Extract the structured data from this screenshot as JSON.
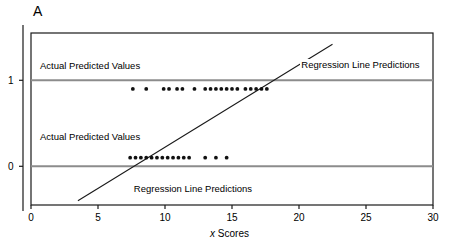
{
  "figure": {
    "panel_label": "A",
    "colors": {
      "frame": "#1a1a1a",
      "reference_line": "#8c8c8c",
      "regression_line": "#1a1a1a",
      "dot": "#111111",
      "text": "#000000"
    }
  },
  "chart_data": {
    "type": "scatter",
    "title": "",
    "subtitle": "",
    "xlabel": "x Scores",
    "xlabel_italic_prefix": "x",
    "xlabel_rest": " Scores",
    "ylabel": "",
    "xlim": [
      0,
      30
    ],
    "ylim": [
      -0.45,
      1.55
    ],
    "xticks": [
      0,
      5,
      10,
      15,
      20,
      25,
      30
    ],
    "xticklabels": [
      "0",
      "5",
      "10",
      "15",
      "20",
      "25",
      "30"
    ],
    "yticks": [
      0,
      1
    ],
    "yticklabels": [
      "0",
      "1"
    ],
    "grid": false,
    "legend": "none",
    "series": [
      {
        "name": "Actual predicted values (y = 1)",
        "type": "scatter",
        "y": 0.9,
        "x": [
          7.6,
          8.6,
          9.9,
          10.3,
          10.9,
          11.3,
          12.2,
          13.0,
          13.4,
          13.8,
          14.2,
          14.6,
          15.0,
          15.4,
          16.0,
          16.4,
          16.8,
          17.2,
          17.6
        ]
      },
      {
        "name": "Actual predicted values (y = 0)",
        "type": "scatter",
        "y": 0.1,
        "x": [
          7.4,
          7.8,
          8.2,
          8.6,
          9.0,
          9.4,
          9.8,
          10.2,
          10.6,
          11.0,
          11.4,
          11.8,
          13.0,
          13.8,
          14.6
        ]
      }
    ],
    "reference_lines": [
      {
        "name": "y-equals-one-line",
        "y": 1
      },
      {
        "name": "y-equals-zero-line",
        "y": 0
      }
    ],
    "regression_line": {
      "name": "Regression Line Predictions",
      "x0": 3.5,
      "y0": -0.4,
      "x1": 22.5,
      "y1": 1.42
    },
    "annotations": [
      {
        "name": "actual-predicted-values-top",
        "text": "Actual Predicted Values",
        "x": 0.6,
        "y": 1.16
      },
      {
        "name": "regression-line-predictions-top",
        "text": "Regression Line Predictions",
        "x": 20.1,
        "y": 1.17
      },
      {
        "name": "actual-predicted-values-bottom",
        "text": "Actual Predicted Values",
        "x": 0.6,
        "y": 0.33
      },
      {
        "name": "regression-line-predictions-bottom",
        "text": "Regression Line Predictions",
        "x": 7.6,
        "y": -0.27
      }
    ]
  }
}
